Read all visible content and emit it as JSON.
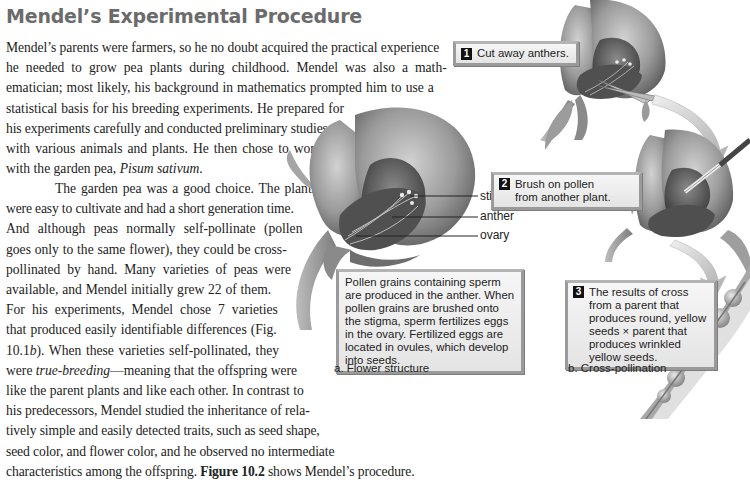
{
  "heading": "Mendel’s Experimental Procedure",
  "body": {
    "lines": [
      "Mendel’s parents were farmers, so he no doubt acquired the practical experience",
      "he needed to grow pea plants during childhood. Mendel was also a math-",
      "ematician; most likely, his background in mathematics prompted him to use a",
      "statistical basis for his breeding experiments. He prepared for",
      "his experiments carefully and conducted preliminary studies",
      "with various animals and plants. He then chose to work",
      "with the garden pea, ",
      "The garden pea was a good choice. The plants",
      "were easy to cultivate and had a short generation time.",
      "And although peas normally self-pollinate (pollen",
      "goes only to the same flower), they could be cross-",
      "pollinated by hand. Many varieties of peas were",
      "available, and Mendel initially grew 22 of them.",
      "For his experiments, Mendel chose 7 varieties",
      "that produced easily identifiable differences (Fig.",
      "10.1",
      "). When these varieties self-pollinated, they",
      "were ",
      "—meaning that the offspring were",
      "like the parent plants and like each other. In contrast to",
      "his predecessors, Mendel studied the inheritance of rela-",
      "tively simple and easily detected traits, such as seed shape,",
      "seed color, and flower color, and he observed no intermediate",
      "characteristics among the offspring. ",
      "Figure 10.2",
      " shows Mendel’s procedure."
    ],
    "species": "Pisum sativum",
    "species_end": ".",
    "fig_letter": "b",
    "term": "true-breeding"
  },
  "figure": {
    "panel_a": {
      "labels": [
        "stigma",
        "anther",
        "ovary"
      ],
      "description": "Pollen grains containing sperm are produced in the anther. When pollen grains are brushed onto the stigma, sperm fertilizes eggs in the ovary. Fertilized eggs are located in ovules, which develop into seeds.",
      "caption": "a. Flower structure"
    },
    "panel_b": {
      "steps": [
        {
          "num": "1",
          "text": "Cut away anthers."
        },
        {
          "num": "2",
          "text": "Brush on pollen from another plant."
        },
        {
          "num": "3",
          "text": "The results of cross from a parent that produces round, yellow seeds × parent that produces wrinkled yellow seeds."
        }
      ],
      "caption": "b. Cross-pollination"
    }
  },
  "colors": {
    "heading": "#6b6b6b",
    "callout_border": "#9a9a9a",
    "callout_bg": "#ececec"
  }
}
